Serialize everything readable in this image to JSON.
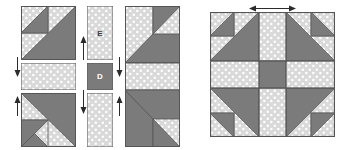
{
  "diagram": {
    "colors": {
      "dark_fabric": "#7b7b7b",
      "light_fabric": "#d9d9d9",
      "dot": "#ffffff",
      "outline": "#555555",
      "arrow": "#2b2b2b",
      "background": "#ffffff"
    },
    "labels": {
      "piece_e": "E",
      "piece_d": "D"
    },
    "groups": [
      {
        "name": "left-column-pieces",
        "items": [
          {
            "name": "top-left-block",
            "x": 21,
            "y": 6,
            "w": 55,
            "h": 54,
            "kind": "corner-block",
            "orientation": "top"
          },
          {
            "name": "middle-left-strip",
            "x": 21,
            "y": 63,
            "w": 55,
            "h": 27,
            "kind": "plain-strip"
          },
          {
            "name": "bottom-left-block",
            "x": 21,
            "y": 93,
            "w": 55,
            "h": 54,
            "kind": "corner-block",
            "orientation": "bottom"
          }
        ]
      },
      {
        "name": "center-column-pieces",
        "items": [
          {
            "name": "piece-e-top",
            "x": 87,
            "y": 6,
            "w": 26,
            "h": 54,
            "kind": "plain-rect",
            "label": "E"
          },
          {
            "name": "piece-d-center",
            "x": 87,
            "y": 63,
            "w": 26,
            "h": 27,
            "kind": "dark-square",
            "label": "D"
          },
          {
            "name": "piece-e-bottom",
            "x": 87,
            "y": 93,
            "w": 26,
            "h": 54,
            "kind": "plain-rect",
            "label": ""
          }
        ]
      },
      {
        "name": "assembled-left-column",
        "items": [
          {
            "name": "assembled-column-unit",
            "x": 125,
            "y": 6,
            "w": 55,
            "h": 141,
            "kind": "assembled-column"
          }
        ]
      },
      {
        "name": "finished-block",
        "items": [
          {
            "name": "finished-quilt-block",
            "x": 210,
            "y": 12,
            "w": 125,
            "h": 125,
            "kind": "finished-block"
          }
        ]
      }
    ],
    "arrows": [
      {
        "name": "arrow-left-upper",
        "x": 13,
        "y": 57,
        "dir": "down",
        "len": 20
      },
      {
        "name": "arrow-left-lower",
        "x": 13,
        "y": 96,
        "dir": "up",
        "len": 20
      },
      {
        "name": "arrow-center-upper",
        "x": 79,
        "y": 57,
        "dir": "up",
        "len": 22
      },
      {
        "name": "arrow-center-lower",
        "x": 79,
        "y": 90,
        "dir": "down",
        "len": 24
      },
      {
        "name": "arrow-right-upper",
        "x": 119,
        "y": 57,
        "dir": "down",
        "len": 20
      },
      {
        "name": "arrow-right-lower",
        "x": 119,
        "y": 96,
        "dir": "up",
        "len": 20
      },
      {
        "name": "arrow-top-left-outward",
        "x": 251,
        "y": 8,
        "dir": "left",
        "len": 26
      },
      {
        "name": "arrow-top-right-outward",
        "x": 272,
        "y": 8,
        "dir": "right",
        "len": 26
      }
    ]
  }
}
